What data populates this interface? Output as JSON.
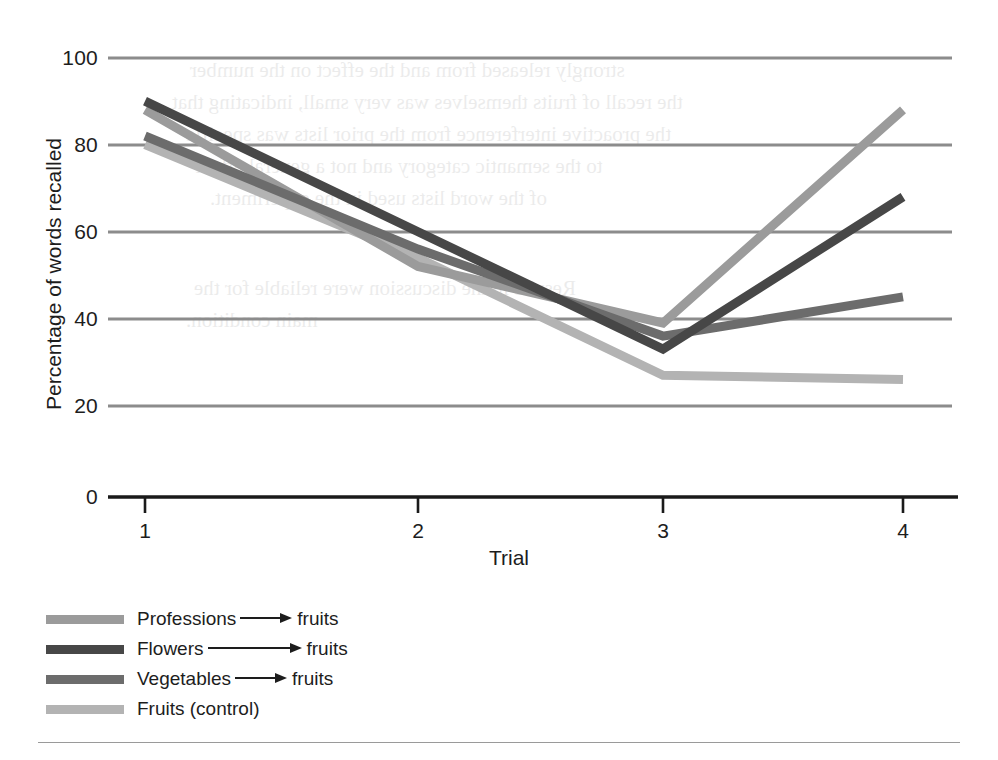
{
  "figure": {
    "background_color": "#ffffff",
    "footer_rule_color": "#9a9a9a"
  },
  "axes": {
    "y_label": "Percentage of words recalled",
    "x_label": "Trial",
    "y_ticks": [
      "0",
      "20",
      "40",
      "60",
      "80",
      "100"
    ],
    "x_ticks": [
      "1",
      "2",
      "3",
      "4"
    ],
    "gridline_color": "#8c8c8c",
    "axis_color": "#1a1a1a"
  },
  "legend": {
    "entries": [
      {
        "name": "Professions",
        "arrow": "right-arrow",
        "target": "fruits",
        "color": "#9b9b9b",
        "full_label": "Professions —→ fruits"
      },
      {
        "name": "Flowers",
        "arrow": "right-arrow",
        "target": "fruits",
        "color": "#474747",
        "full_label": "Flowers —→ fruits"
      },
      {
        "name": "Vegetables",
        "arrow": "right-arrow",
        "target": "fruits",
        "color": "#6c6c6c",
        "full_label": "Vegetables —→ fruits"
      },
      {
        "name": "Fruits (control)",
        "arrow": "none",
        "target": "",
        "color": "#b3b3b3",
        "full_label": "Fruits (control)"
      }
    ]
  },
  "bleed_through": {
    "note": "faint mirrored text showing through from the reverse side of the scanned page",
    "lines": [
      "strongly released from and the effect on the number",
      "the recall of fruits themselves was very small, indicating that",
      "the proactive interference from the prior lists was specific",
      "to the semantic category and not a general effect",
      "of the word lists used in the experiment.",
      "Results in the discussion were reliable for the",
      "main condition."
    ]
  },
  "chart_data": {
    "type": "line",
    "title": "",
    "xlabel": "Trial",
    "ylabel": "Percentage of words recalled",
    "x": [
      1,
      2,
      3,
      4
    ],
    "xtick_labels": [
      "1",
      "2",
      "3",
      "4"
    ],
    "ylim": [
      0,
      100
    ],
    "yticks": [
      0,
      20,
      40,
      60,
      80,
      100
    ],
    "grid": "horizontal gridlines at 20, 40, 60, 80, 100",
    "legend_position": "below plot, lower-left",
    "series": [
      {
        "name": "Professions → fruits",
        "color": "#9b9b9b",
        "values": [
          89,
          53,
          40,
          89
        ]
      },
      {
        "name": "Flowers → fruits",
        "color": "#474747",
        "values": [
          91,
          61,
          34,
          69
        ]
      },
      {
        "name": "Vegetables → fruits",
        "color": "#6c6c6c",
        "values": [
          83,
          57,
          37,
          46
        ]
      },
      {
        "name": "Fruits (control)",
        "color": "#b3b3b3",
        "values": [
          81,
          55,
          28,
          27
        ]
      }
    ]
  }
}
